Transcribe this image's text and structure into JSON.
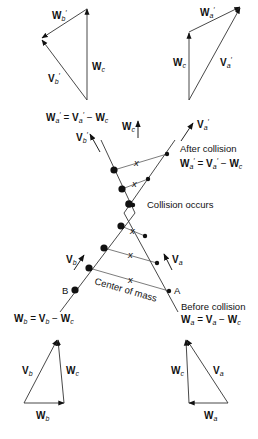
{
  "diagram": {
    "top_left_triangle": {
      "labels": [
        "W'b",
        "V'b",
        "Wc"
      ]
    },
    "top_right_triangle": {
      "labels": [
        "W'a",
        "Wc",
        "V'a"
      ]
    },
    "bottom_left_triangle": {
      "labels": [
        "Vb",
        "Wc",
        "Wb"
      ]
    },
    "bottom_right_triangle": {
      "labels": [
        "Wc",
        "Va",
        "Wa"
      ]
    },
    "equations": {
      "after_top": "W'a = V'a − Wc",
      "after_right": "W'a = V'a − Wc",
      "before_left": "Wb = Vb − Wc",
      "before_right": "Wa = Va − Wc"
    },
    "annotations": {
      "after_collision": "After collision",
      "collision_occurs": "Collision occurs",
      "before_collision": "Before collision",
      "center_of_mass": "Center of mass",
      "point_a": "A",
      "point_b": "B",
      "com_marker": "x"
    },
    "vector_labels": {
      "v_b_prime": "V'b",
      "w_c": "Wc",
      "v_a_prime": "V'a",
      "v_b": "Vb",
      "v_a": "Va"
    }
  }
}
